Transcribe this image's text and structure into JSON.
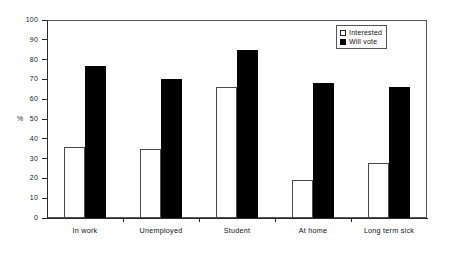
{
  "chart_data": {
    "type": "bar",
    "title": "",
    "xlabel": "",
    "ylabel": "%",
    "ylim": [
      0,
      100
    ],
    "ytick_step": 10,
    "yticks": [
      0,
      10,
      20,
      30,
      40,
      50,
      60,
      70,
      80,
      90,
      100
    ],
    "grid": false,
    "legend_position": "top-right",
    "categories": [
      "In work",
      "Unemployed",
      "Student",
      "At home",
      "Long term sick"
    ],
    "series": [
      {
        "name": "Interested",
        "color": "#ffffff",
        "values": [
          36,
          35,
          66,
          19,
          28
        ]
      },
      {
        "name": "Will vote",
        "color": "#000000",
        "values": [
          77,
          70,
          85,
          68,
          66
        ]
      }
    ]
  },
  "legend": {
    "items": [
      {
        "label": "Interested",
        "swatch": "white-square-icon"
      },
      {
        "label": "Will vote",
        "swatch": "black-square-icon"
      }
    ]
  },
  "axes": {
    "y_title": "%"
  }
}
